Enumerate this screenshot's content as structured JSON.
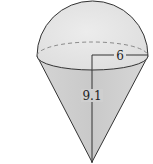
{
  "figure": {
    "labels": {
      "radius": "6",
      "cone_height": "9.1"
    },
    "colors": {
      "fill": "#d9d9d9",
      "fill_light": "#e6e6e6",
      "stroke": "#333333",
      "dashed": "#8a8a8a"
    }
  }
}
